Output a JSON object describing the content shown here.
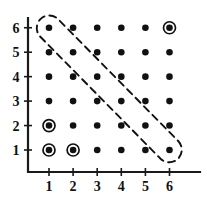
{
  "figure": {
    "title": "",
    "background_color": "#ffffff",
    "ink_color": "#111111"
  },
  "chart_data": {
    "type": "scatter",
    "title": "",
    "xlabel": "",
    "ylabel": "",
    "xlim": [
      0,
      7
    ],
    "ylim": [
      0,
      7
    ],
    "grid": false,
    "legend": "none",
    "x_ticks": [
      "1",
      "2",
      "3",
      "4",
      "5",
      "6"
    ],
    "y_ticks": [
      "1",
      "2",
      "3",
      "4",
      "5",
      "6"
    ],
    "x_tick_values": [
      1,
      2,
      3,
      4,
      5,
      6
    ],
    "y_tick_values": [
      1,
      2,
      3,
      4,
      5,
      6
    ],
    "series": [
      {
        "name": "lattice-points",
        "marker": "filled-dot",
        "points": [
          [
            1,
            1
          ],
          [
            2,
            1
          ],
          [
            3,
            1
          ],
          [
            4,
            1
          ],
          [
            5,
            1
          ],
          [
            6,
            1
          ],
          [
            1,
            2
          ],
          [
            2,
            2
          ],
          [
            3,
            2
          ],
          [
            4,
            2
          ],
          [
            5,
            2
          ],
          [
            6,
            2
          ],
          [
            1,
            3
          ],
          [
            2,
            3
          ],
          [
            3,
            3
          ],
          [
            4,
            3
          ],
          [
            5,
            3
          ],
          [
            6,
            3
          ],
          [
            1,
            4
          ],
          [
            2,
            4
          ],
          [
            3,
            4
          ],
          [
            4,
            4
          ],
          [
            5,
            4
          ],
          [
            6,
            4
          ],
          [
            1,
            5
          ],
          [
            2,
            5
          ],
          [
            3,
            5
          ],
          [
            4,
            5
          ],
          [
            5,
            5
          ],
          [
            6,
            5
          ],
          [
            1,
            6
          ],
          [
            2,
            6
          ],
          [
            3,
            6
          ],
          [
            4,
            6
          ],
          [
            5,
            6
          ],
          [
            6,
            6
          ]
        ]
      },
      {
        "name": "circled-points",
        "marker": "dot-with-ring",
        "points": [
          [
            1,
            1
          ],
          [
            2,
            1
          ],
          [
            1,
            2
          ],
          [
            6,
            6
          ]
        ]
      }
    ],
    "annotations": [
      {
        "name": "dashed-capsule",
        "shape": "capsule",
        "style": "dashed",
        "encloses": [
          [
            1,
            6
          ],
          [
            2,
            5
          ],
          [
            3,
            4
          ],
          [
            4,
            3
          ],
          [
            5,
            2
          ],
          [
            6,
            1
          ]
        ],
        "from": [
          1,
          6
        ],
        "to": [
          6,
          1
        ]
      }
    ]
  }
}
